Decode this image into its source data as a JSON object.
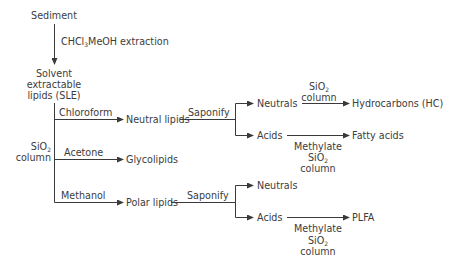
{
  "diagram": {
    "nodes": {
      "sediment": "Sediment",
      "extraction_label_pre": "CHCl",
      "extraction_label_sub": "3",
      "extraction_label_post": "MeOH extraction",
      "sle_line1": "Solvent",
      "sle_line2": "extractable",
      "sle_line3": "lipids (SLE)",
      "sio2_left_pre": "SiO",
      "sio2_left_sub": "2",
      "sio2_left_line2": "column",
      "chloroform": "Chloroform",
      "acetone": "Acetone",
      "methanol": "Methanol",
      "neutral_lipids": "Neutral lipids",
      "glycolipids": "Glycolipids",
      "polar_lipids": "Polar lipids",
      "saponify_top": "Saponify",
      "saponify_bottom": "Saponify",
      "neutrals_top": "Neutrals",
      "acids_top": "Acids",
      "neutrals_bottom": "Neutrals",
      "acids_bottom": "Acids",
      "hc_sio2_pre": "SiO",
      "hc_sio2_sub": "2",
      "hc_column": "column",
      "hydrocarbons": "Hydrocarbons (HC)",
      "fatty_acids": "Fatty acids",
      "fa_methylate": "Methylate",
      "fa_sio2_pre": "SiO",
      "fa_sio2_sub": "2",
      "fa_column": "column",
      "plfa": "PLFA",
      "plfa_methylate": "Methylate",
      "plfa_sio2_pre": "SiO",
      "plfa_sio2_sub": "2",
      "plfa_column": "column"
    },
    "line_color": "#3a3a3a"
  }
}
